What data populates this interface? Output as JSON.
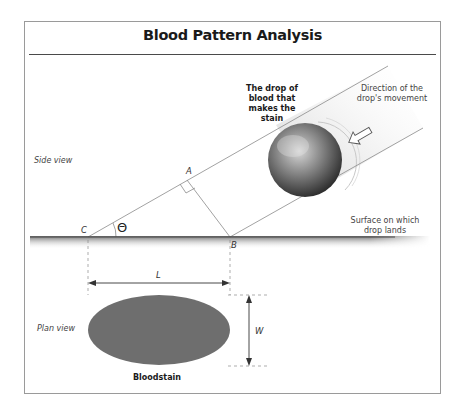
{
  "title": "Blood Pattern Analysis",
  "views": {
    "side_view": "Side view",
    "plan_view": "Plan view"
  },
  "labels": {
    "drop": "The drop of blood that makes the stain",
    "drop_line1": "The drop of",
    "drop_line2": "blood that",
    "drop_line3": "makes the",
    "drop_line4": "stain",
    "direction_line1": "Direction of the",
    "direction_line2": "drop's movement",
    "surface_line1": "Surface on which",
    "surface_line2": "drop lands",
    "bloodstain": "Bloodstain"
  },
  "points": {
    "A": "A",
    "B": "B",
    "C": "C",
    "theta": "Θ"
  },
  "dimensions": {
    "length": "L",
    "width": "W"
  },
  "colors": {
    "stain": "#6e6e6e",
    "lines": "#8a8a8a",
    "frame": "#9a9a9a"
  }
}
